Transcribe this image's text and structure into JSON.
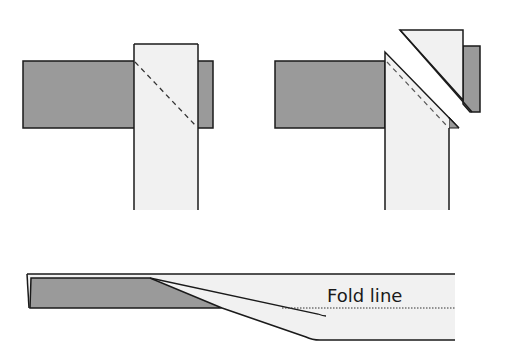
{
  "diagram": {
    "colors": {
      "dark_fabric": "#9a9a9a",
      "light_fabric": "#f1f1f1",
      "outline": "#1a1a1a",
      "background": "#ffffff"
    },
    "panels": [
      {
        "id": "step-1",
        "content": "Light vertical strip laid over dark horizontal strip with dashed diagonal stitch line"
      },
      {
        "id": "step-2",
        "content": "Corner trimmed along diagonal; detached triangle shown offset"
      },
      {
        "id": "step-3",
        "content": "Side view of joined strip with fold line"
      }
    ],
    "labels": {
      "fold_line": "Fold line"
    }
  }
}
